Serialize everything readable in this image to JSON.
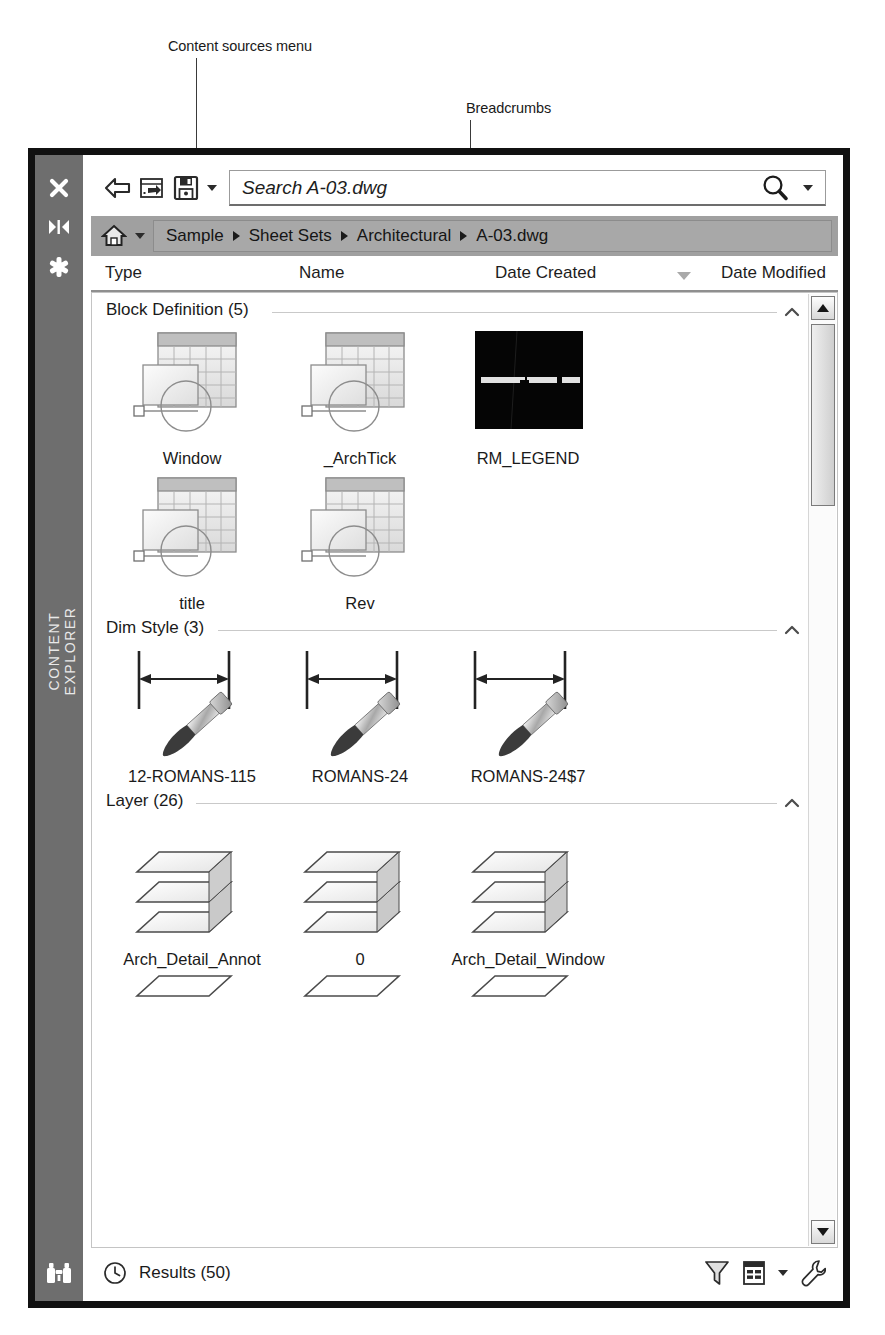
{
  "annotations": [
    {
      "text": "Content sources menu",
      "x": 168,
      "y": 38,
      "leader_x": 196,
      "leader_top": 58,
      "leader_h": 88
    },
    {
      "text": "Breadcrumbs",
      "x": 466,
      "y": 100,
      "leader_x": 470,
      "leader_top": 118,
      "leader_h": 128
    }
  ],
  "panel": {
    "title": "CONTENT EXPLORER",
    "strip_icons": [
      {
        "name": "close-icon",
        "glyph": "✕"
      },
      {
        "name": "auto-hide-icon",
        "glyph": "▶◀"
      },
      {
        "name": "panel-properties-icon",
        "glyph": "✹"
      }
    ],
    "bottom_icon": "binoculars-icon"
  },
  "toolbar": {
    "back_label": "back-arrow",
    "add_source_label": "add-content-source",
    "save_label": "save",
    "save_caret": "save-dropdown",
    "search": {
      "value": "Search A-03.dwg",
      "placeholder": "Search A-03.dwg",
      "icon": "magnifier-icon",
      "caret": "search-options-dropdown"
    }
  },
  "breadcrumbs": {
    "home_icon": "home-icon",
    "home_caret": "content-sources-dropdown",
    "items": [
      "Sample",
      "Sheet Sets",
      "Architectural",
      "A-03.dwg"
    ],
    "separator": "▶"
  },
  "columns": [
    {
      "label": "Type",
      "x": 14
    },
    {
      "label": "Name",
      "x": 208
    },
    {
      "label": "Date Created",
      "x": 404,
      "sorted": true,
      "sort_dir": "desc",
      "sort_x": 594
    },
    {
      "label": "Date Modified",
      "x": 630
    }
  ],
  "sections": [
    {
      "label": "Block Definition (5)",
      "count": 5,
      "rule_left": 180,
      "collapse_icon": "chevron-up-icon",
      "rows": [
        [
          {
            "name": "Window",
            "icon": "block-definition-icon"
          },
          {
            "name": "_ArchTick",
            "icon": "block-definition-icon"
          },
          {
            "name": "RM_LEGEND",
            "icon": "preview-thumbnail-dark"
          }
        ],
        [
          {
            "name": "title",
            "icon": "block-definition-icon"
          },
          {
            "name": "Rev",
            "icon": "block-definition-icon"
          }
        ]
      ]
    },
    {
      "label": "Dim Style (3)",
      "count": 3,
      "rule_left": 126,
      "collapse_icon": "chevron-up-icon",
      "rows": [
        [
          {
            "name": "12-ROMANS-115",
            "icon": "dim-style-icon"
          },
          {
            "name": "ROMANS-24",
            "icon": "dim-style-icon"
          },
          {
            "name": "ROMANS-24$7",
            "icon": "dim-style-icon"
          }
        ]
      ]
    },
    {
      "label": "Layer (26)",
      "count": 26,
      "rule_left": 104,
      "collapse_icon": "chevron-up-icon",
      "rows": [
        [
          {
            "name": "Arch_Detail_Annot",
            "icon": "layer-icon"
          },
          {
            "name": "0",
            "icon": "layer-icon"
          },
          {
            "name": "Arch_Detail_Window",
            "icon": "layer-icon"
          }
        ],
        [
          {
            "name": "",
            "icon": "layer-icon"
          },
          {
            "name": "",
            "icon": "layer-icon"
          },
          {
            "name": "",
            "icon": "layer-icon"
          }
        ]
      ]
    }
  ],
  "scrollbar": {
    "up_icon": "scroll-up-arrow",
    "down_icon": "scroll-down-arrow",
    "thumb": "scroll-thumb"
  },
  "statusbar": {
    "clock_icon": "clock-icon",
    "results_label": "Results (50)",
    "filter_icon": "filter-funnel-icon",
    "view_icon": "view-list-icon",
    "view_caret": "view-options-dropdown",
    "tools_icon": "wrench-icon"
  }
}
